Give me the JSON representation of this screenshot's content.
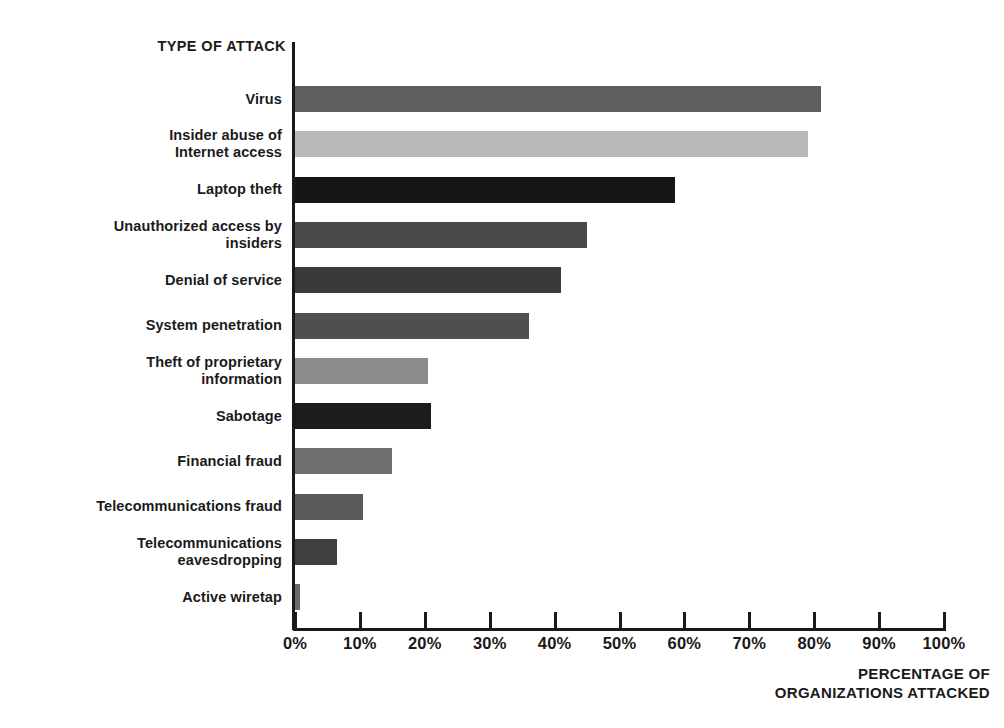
{
  "chart_data": {
    "type": "bar",
    "orientation": "horizontal",
    "title": "",
    "ylabel": "TYPE OF ATTACK",
    "xlabel": "PERCENTAGE OF\nORGANIZATIONS ATTACKED",
    "xlim": [
      0,
      100
    ],
    "xticks": [
      0,
      10,
      20,
      30,
      40,
      50,
      60,
      70,
      80,
      90,
      100
    ],
    "xtick_labels": [
      "0%",
      "10%",
      "20%",
      "30%",
      "40%",
      "50%",
      "60%",
      "70%",
      "80%",
      "90%",
      "100%"
    ],
    "grid": false,
    "legend": "none",
    "categories": [
      "Virus",
      "Insider abuse of\nInternet access",
      "Laptop theft",
      "Unauthorized access by\ninsiders",
      "Denial of service",
      "System penetration",
      "Theft of proprietary\ninformation",
      "Sabotage",
      "Financial fraud",
      "Telecommunications fraud",
      "Telecommunications\neavesdropping",
      "Active wiretap"
    ],
    "values": [
      81,
      79,
      58.5,
      45,
      41,
      36,
      20.5,
      21,
      15,
      10.5,
      6.5,
      0.8
    ],
    "bar_colors": [
      "#5e5e5e",
      "#b9b9b9",
      "#151515",
      "#4a4a4a",
      "#3a3a3a",
      "#4f4f4f",
      "#8c8c8c",
      "#1c1c1c",
      "#707070",
      "#5a5a5a",
      "#3f3f3f",
      "#6a6a6a"
    ],
    "axis_color": "#1a1a1a",
    "background_color": "#ffffff"
  }
}
